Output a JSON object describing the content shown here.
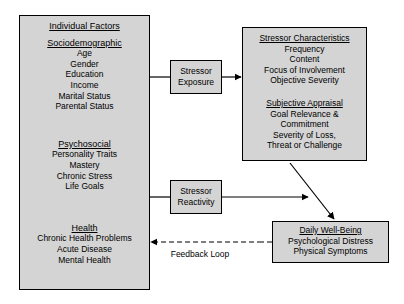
{
  "diagram": {
    "colors": {
      "box_fill": "#d4d4d4",
      "border": "#000000",
      "background": "#ffffff",
      "line": "#000000"
    },
    "boxes": {
      "individual_factors": {
        "title": "Individual Factors",
        "groups": [
          {
            "heading": "Sociodemographic",
            "items": [
              "Age",
              "Gender",
              "Education",
              "Income",
              "Marital Status",
              "Parental Status"
            ]
          },
          {
            "heading": "Psychosocial",
            "items": [
              "Personality Traits",
              "Mastery",
              "Chronic Stress",
              "Life Goals"
            ]
          },
          {
            "heading": "Health",
            "items": [
              "Chronic Health Problems",
              "Acute Disease",
              "Mental Health"
            ]
          }
        ]
      },
      "stressor_characteristics": {
        "groups": [
          {
            "heading": "Stressor Characteristics",
            "items": [
              "Frequency",
              "Content",
              "Focus of Involvement",
              "Objective Severity"
            ]
          },
          {
            "heading": "Subjective Appraisal",
            "items": [
              "Goal Relevance &",
              "Commitment",
              "Severity of Loss,",
              "Threat or Challenge"
            ]
          }
        ]
      },
      "stressor_exposure": {
        "line1": "Stressor",
        "line2": "Exposure"
      },
      "stressor_reactivity": {
        "line1": "Stressor",
        "line2": "Reactivity"
      },
      "daily_wellbeing": {
        "heading": "Daily Well-Being",
        "items": [
          "Psychological Distress",
          "Physical Symptoms"
        ]
      }
    },
    "connectors": {
      "feedback_loop_label": "Feedback Loop"
    }
  }
}
